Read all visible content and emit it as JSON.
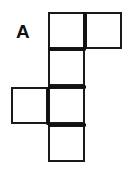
{
  "figure": {
    "label": "A",
    "label_x": 16,
    "label_y": 22,
    "background_color": "#ffffff",
    "stroke_color": "#1a1a1a",
    "stroke_width": 2,
    "fill_color": "#ffffff",
    "cell_size": 37,
    "cells": [
      {
        "name": "top-left-square",
        "x": 48,
        "y": 12,
        "w": 37,
        "h": 37
      },
      {
        "name": "top-right-square",
        "x": 85,
        "y": 12,
        "w": 37,
        "h": 37
      },
      {
        "name": "second-row-square",
        "x": 48,
        "y": 49,
        "w": 37,
        "h": 37
      },
      {
        "name": "third-row-left-square",
        "x": 11,
        "y": 87,
        "w": 37,
        "h": 37
      },
      {
        "name": "third-row-square",
        "x": 48,
        "y": 87,
        "w": 37,
        "h": 37
      },
      {
        "name": "bottom-row-square",
        "x": 48,
        "y": 125,
        "w": 37,
        "h": 37
      }
    ],
    "heavy_edges": [
      {
        "name": "edge-top-between-squares",
        "x1": 85,
        "y1": 12,
        "x2": 85,
        "y2": 49
      },
      {
        "name": "edge-under-top-left",
        "x1": 48,
        "y1": 49,
        "x2": 86,
        "y2": 49
      },
      {
        "name": "edge-above-third-row",
        "x1": 48,
        "y1": 87,
        "x2": 86,
        "y2": 87
      },
      {
        "name": "edge-left-of-third-row",
        "x1": 48,
        "y1": 87,
        "x2": 48,
        "y2": 125
      },
      {
        "name": "edge-under-third-row",
        "x1": 48,
        "y1": 125,
        "x2": 86,
        "y2": 125
      }
    ]
  }
}
